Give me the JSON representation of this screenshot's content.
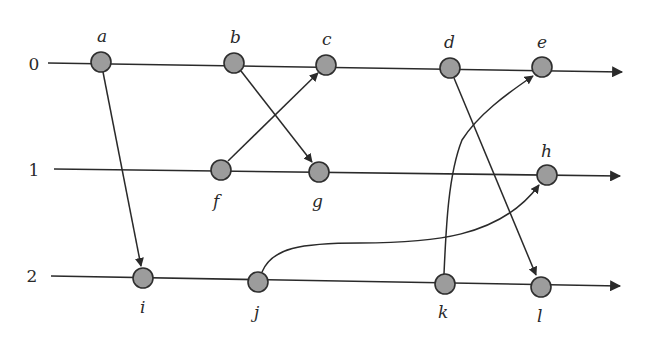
{
  "diagram": {
    "type": "space-time diagram",
    "processes": [
      {
        "id": "0",
        "label": "0",
        "label_x": 34,
        "label_y": 70,
        "x1": 48,
        "y1": 63,
        "x2": 622,
        "y2": 72
      },
      {
        "id": "1",
        "label": "1",
        "label_x": 34,
        "label_y": 176,
        "x1": 54,
        "y1": 169,
        "x2": 620,
        "y2": 176
      },
      {
        "id": "2",
        "label": "2",
        "label_x": 32,
        "label_y": 282,
        "x1": 51,
        "y1": 276,
        "x2": 620,
        "y2": 286
      }
    ],
    "events": [
      {
        "id": "a",
        "label": "a",
        "process": "0",
        "x": 101,
        "y": 62,
        "lx": 97,
        "ly": 42
      },
      {
        "id": "b",
        "label": "b",
        "process": "0",
        "x": 234,
        "y": 63,
        "lx": 230,
        "ly": 43
      },
      {
        "id": "c",
        "label": "c",
        "process": "0",
        "x": 326,
        "y": 65,
        "lx": 322,
        "ly": 45
      },
      {
        "id": "d",
        "label": "d",
        "process": "0",
        "x": 450,
        "y": 68,
        "lx": 444,
        "ly": 48
      },
      {
        "id": "e",
        "label": "e",
        "process": "0",
        "x": 542,
        "y": 67,
        "lx": 537,
        "ly": 48
      },
      {
        "id": "f",
        "label": "f",
        "process": "1",
        "x": 221,
        "y": 170,
        "lx": 213,
        "ly": 207
      },
      {
        "id": "g",
        "label": "g",
        "process": "1",
        "x": 319,
        "y": 172,
        "lx": 312,
        "ly": 207
      },
      {
        "id": "h",
        "label": "h",
        "process": "1",
        "x": 547,
        "y": 175,
        "lx": 541,
        "ly": 157
      },
      {
        "id": "i",
        "label": "i",
        "process": "2",
        "x": 143,
        "y": 278,
        "lx": 140,
        "ly": 313
      },
      {
        "id": "j",
        "label": "j",
        "process": "2",
        "x": 258,
        "y": 282,
        "lx": 254,
        "ly": 318
      },
      {
        "id": "k",
        "label": "k",
        "process": "2",
        "x": 445,
        "y": 284,
        "lx": 438,
        "ly": 318
      },
      {
        "id": "l",
        "label": "l",
        "process": "2",
        "x": 541,
        "y": 287,
        "lx": 537,
        "ly": 322
      }
    ],
    "messages": [
      {
        "from": "a",
        "to": "i",
        "path": "M103,72 L141,266"
      },
      {
        "from": "b",
        "to": "g",
        "path": "M241,71 L312,162"
      },
      {
        "from": "f",
        "to": "c",
        "path": "M228,161 L318,73"
      },
      {
        "from": "d",
        "to": "l",
        "path": "M454,78 L536,275"
      },
      {
        "from": "k",
        "to": "e",
        "path": "M444,274 C446,230 448,175 462,140 C478,115 505,95 533,76"
      },
      {
        "from": "j",
        "to": "h",
        "path": "M262,272 C272,248 300,243 360,243 C430,243 500,238 539,185"
      }
    ],
    "node_radius": 10,
    "colors": {
      "node_fill": "#9c9c9c",
      "node_stroke": "#2e2e2e",
      "line": "#2a2a2a",
      "background": "#ffffff"
    }
  }
}
